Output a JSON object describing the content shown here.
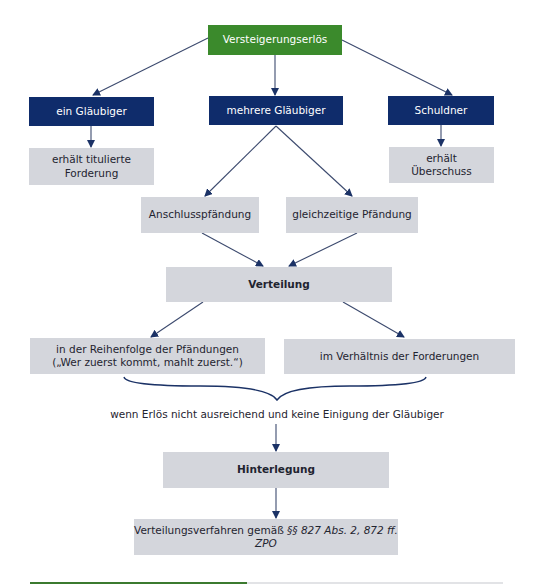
{
  "diagram": {
    "root": {
      "label": "Versteigerungserlös",
      "color": "#3b8a2c"
    },
    "branches": [
      {
        "label": "ein Gläubiger",
        "result": [
          "erhält titulierte",
          "Forderung"
        ]
      },
      {
        "label": "mehrere Gläubiger"
      },
      {
        "label": "Schuldner",
        "result": [
          "erhält",
          "Überschuss"
        ]
      }
    ],
    "pfaendung": [
      {
        "label": "Anschlusspfändung"
      },
      {
        "label": "gleichzeitige Pfändung"
      }
    ],
    "verteilung": {
      "label": "Verteilung"
    },
    "verteilung_options": [
      {
        "lines": [
          "in der Reihenfolge der Pfändungen",
          "(„Wer zuerst kommt, mahlt zuerst.“)"
        ]
      },
      {
        "lines": [
          "im Verhältnis der Forderungen"
        ]
      }
    ],
    "condition": "wenn Erlös nicht ausreichend und keine Einigung der Gläubiger",
    "hinterlegung": {
      "label": "Hinterlegung"
    },
    "final": {
      "prefix": "Verteilungsverfahren gemäß ",
      "legal_ref": "§§ 827 Abs. 2, 872 ff. ZPO"
    },
    "colors": {
      "primary_navy": "#0f2c6b",
      "accent_green": "#3b8a2c",
      "box_grey": "#d4d6dc",
      "arrow": "#1b3266"
    }
  }
}
